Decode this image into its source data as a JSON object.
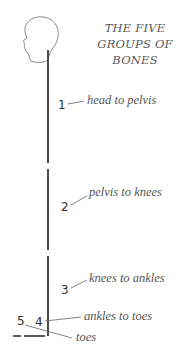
{
  "title": {
    "lines": [
      "THE FIVE",
      "GROUPS OF",
      "BONES"
    ]
  },
  "groups": [
    {
      "number": "1",
      "label": "head to pelvis"
    },
    {
      "number": "2",
      "label": "pelvis to knees"
    },
    {
      "number": "3",
      "label": "knees to ankles"
    },
    {
      "number": "4",
      "label": "ankles to toes"
    },
    {
      "number": "5",
      "label": "toes"
    }
  ],
  "icons": {
    "head": "head-profile-outline"
  },
  "colors": {
    "line": "#4a4a4a",
    "text": "#555555",
    "outline": "#7a7a7a"
  }
}
